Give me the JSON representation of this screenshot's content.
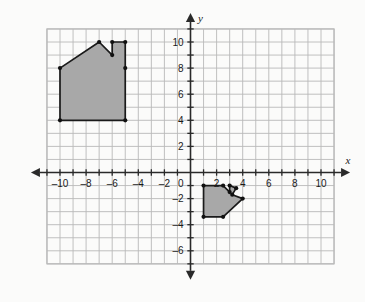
{
  "chart_data": {
    "type": "scatter",
    "title": "",
    "xlabel": "x",
    "ylabel": "y",
    "xlim": [
      -11.5,
      11.5
    ],
    "ylim": [
      -7.5,
      11.5
    ],
    "grid": true,
    "grid_step": 1,
    "legend": "none",
    "x_tick_labels": [
      "-10",
      "-8",
      "-6",
      "-4",
      "-2",
      "2",
      "4",
      "6",
      "8",
      "10"
    ],
    "x_tick_values": [
      -10,
      -8,
      -6,
      -4,
      -2,
      2,
      4,
      6,
      8,
      10
    ],
    "y_tick_labels": [
      "10",
      "8",
      "6",
      "4",
      "2",
      "-2",
      "-4",
      "-6"
    ],
    "y_tick_values": [
      10,
      8,
      6,
      4,
      2,
      -2,
      -4,
      -6
    ],
    "origin_label": "0",
    "series": [
      {
        "name": "large-house-polygon",
        "type": "polygon",
        "fill": "#a8a8a8",
        "stroke": "#1a1a1a",
        "vertices": [
          [
            -10,
            8
          ],
          [
            -7,
            10
          ],
          [
            -6,
            9
          ],
          [
            -6,
            10
          ],
          [
            -5,
            10
          ],
          [
            -5,
            8
          ],
          [
            -5,
            4
          ],
          [
            -10,
            4
          ]
        ]
      },
      {
        "name": "small-house-polygon",
        "type": "polygon",
        "fill": "#a8a8a8",
        "stroke": "#1a1a1a",
        "vertices": [
          [
            1,
            -1
          ],
          [
            2.5,
            -1
          ],
          [
            3,
            -1.5
          ],
          [
            3,
            -1
          ],
          [
            3.5,
            -1.2
          ],
          [
            3.2,
            -1.7
          ],
          [
            4,
            -2
          ],
          [
            2.5,
            -3.4
          ],
          [
            1,
            -3.4
          ]
        ]
      }
    ]
  },
  "colors": {
    "background": "#fbfbfa",
    "grid_line": "#b9b9b9",
    "axis_line": "#2a2a2a",
    "plot_border": "#b9b9b9",
    "shape_fill": "#a8a8a8",
    "shape_stroke": "#1a1a1a",
    "vertex_dot": "#111111",
    "text": "#1a1a1a"
  },
  "axis_labels": {
    "x": "x",
    "y": "y"
  }
}
